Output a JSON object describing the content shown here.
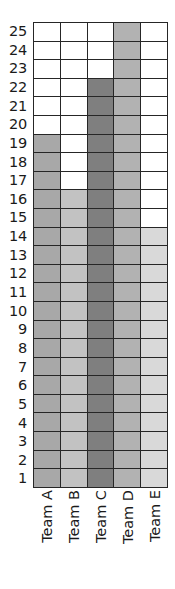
{
  "chart_data": {
    "type": "bar",
    "title": "",
    "subtitle": "",
    "xlabel": "",
    "ylabel": "",
    "categories": [
      "Team A",
      "Team B",
      "Team C",
      "Team D",
      "Team E"
    ],
    "values": [
      19,
      16,
      22,
      25,
      14
    ],
    "series": [
      {
        "name": "Filled units",
        "values": [
          19,
          16,
          22,
          25,
          14
        ]
      }
    ],
    "ylim": [
      0,
      25
    ],
    "y_tick_labels": [
      "25",
      "24",
      "23",
      "22",
      "21",
      "20",
      "19",
      "18",
      "17",
      "16",
      "15",
      "14",
      "13",
      "12",
      "11",
      "10",
      "9",
      "8",
      "7",
      "6",
      "5",
      "4",
      "3",
      "2",
      "1"
    ],
    "grid": true,
    "legend": "none",
    "bar_colors": [
      "#a8a8a8",
      "#c2c2c2",
      "#7f7f7f",
      "#b2b2b2",
      "#d9d9d9"
    ],
    "empty_color": "#ffffff",
    "grid_line_color": "#262626",
    "annotations": []
  }
}
